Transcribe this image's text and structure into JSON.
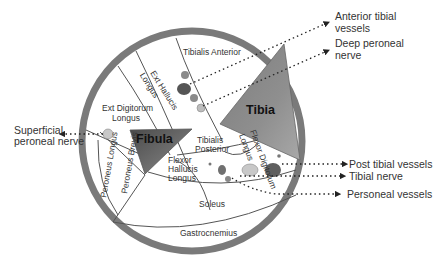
{
  "colors": {
    "outer_ring": "#7a7a7a",
    "bone_dark": "#555555",
    "bone_light": "#c9c9c9",
    "vessel_dark": "#6a6a6a",
    "vessel_light": "#c8c8c8",
    "line": "#444444",
    "text": "#333333"
  },
  "bones": {
    "tibia": "Tibia",
    "fibula": "Fibula"
  },
  "muscles": {
    "tibialis_anterior": "Tibialis Anterior",
    "ext_hallucis_1": "Ext Hallucis",
    "ext_hallucis_2": "Longus",
    "ext_digitorum_1": "Ext Digitorum",
    "ext_digitorum_2": "Longus",
    "flexor_digitorum_1": "Flexor Digitorum",
    "flexor_digitorum_2": "Longus",
    "tibialis_posterior_1": "Tibialis",
    "tibialis_posterior_2": "Posterior",
    "flexor_hallucis_1": "Flexor",
    "flexor_hallucis_2": "Hallucis",
    "flexor_hallucis_3": "Longus",
    "peroneus_longus": "Peroneus Longus",
    "peroneus_brevis": "Peroneus Brevis",
    "soleus": "Soleus",
    "gastrocnemius": "Gastrocnemius"
  },
  "callouts": {
    "anterior_tibial_1": "Anterior tibial",
    "anterior_tibial_2": "vessels",
    "deep_peroneal_1": "Deep peroneal",
    "deep_peroneal_2": "nerve",
    "superficial_peroneal_1": "Superficial",
    "superficial_peroneal_2": "peroneal nerve",
    "post_tibial": "Post tibial vessels",
    "tibial_nerve": "Tibial nerve",
    "peroneal_vessels": "Personeal vessels"
  }
}
